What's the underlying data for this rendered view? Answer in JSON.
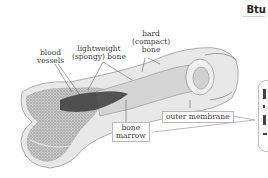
{
  "brand": {
    "text": "Btu"
  },
  "diagram": {
    "labels": {
      "blood_vessels": [
        "blood",
        "vessels"
      ],
      "spongy_bone": [
        "lightweight",
        "(spongy) bone"
      ],
      "compact_bone": [
        "hard",
        "(compact)",
        "bone"
      ],
      "bone_marrow": [
        "bone",
        "marrow"
      ],
      "outer_membrane": "outer membrane"
    }
  },
  "colors": {
    "bone_outer": "#e6e6e6",
    "bone_spongy": "#a8a8a8",
    "marrow_dark": "#3c3c3c",
    "leader_line": "#b0b0b0",
    "text": "#3a3a3a"
  }
}
